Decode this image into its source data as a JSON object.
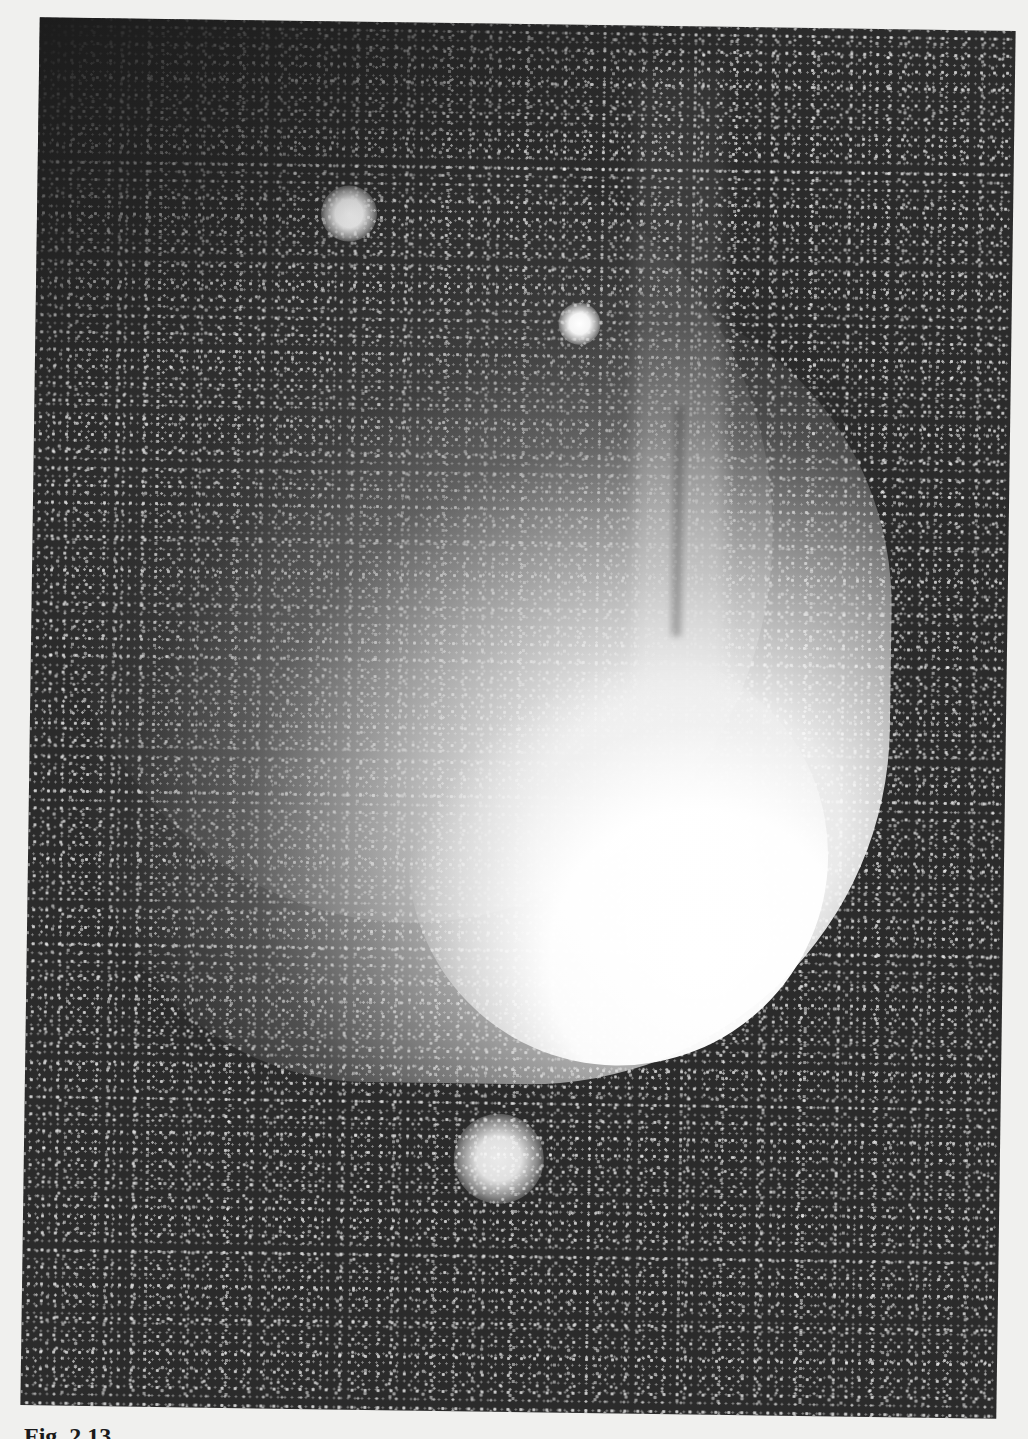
{
  "figure": {
    "type": "astronomical photograph (comet with ion tail and coma against star field)",
    "background_color": "#2b2b2b",
    "coma_color": "#ffffff",
    "page_color": "#f0f0ee",
    "bright_objects": [
      {
        "name": "bright-star-upper-left",
        "x": 340,
        "y": 210,
        "radius": 22
      },
      {
        "name": "bright-star-upper-middle",
        "x": 572,
        "y": 322,
        "radius": 16
      },
      {
        "name": "fuzzy-cluster-lower",
        "x": 505,
        "y": 1155,
        "radius": 36
      }
    ],
    "comet": {
      "head_position": {
        "x": 720,
        "y": 990
      },
      "ion_tail_direction": "up",
      "dust_coma_direction": "upper-left"
    }
  },
  "caption": {
    "text": "Fig. 2.13"
  }
}
